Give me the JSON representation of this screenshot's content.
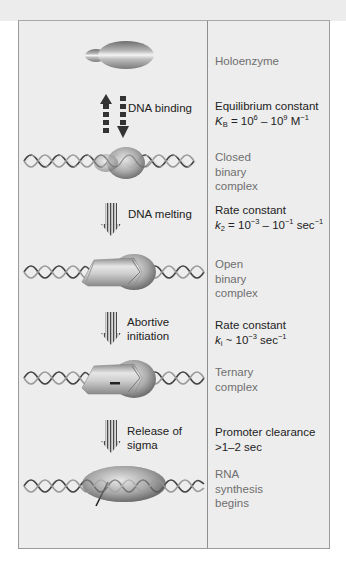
{
  "figure": {
    "colors": {
      "background": "#ececec",
      "frame_fill": "#ededed",
      "frame_border": "#9a9a9a",
      "state_text": "#6f6f6f",
      "step_text": "#222222",
      "dna_strand": "#555555",
      "enzyme_dark": "#7a7a7a",
      "enzyme_light": "#f0f0f0"
    },
    "states": [
      {
        "id": "holoenzyme",
        "label": "Holoenzyme"
      },
      {
        "id": "closed",
        "label": "Closed\nbinary\ncomplex"
      },
      {
        "id": "open",
        "label": "Open\nbinary\ncomplex"
      },
      {
        "id": "ternary",
        "label": "Ternary\ncomplex"
      },
      {
        "id": "rna",
        "label": "RNA\nsynthesis\nbegins"
      }
    ],
    "steps": [
      {
        "id": "dna-binding",
        "label": "DNA binding",
        "arrow": "reversible",
        "param_title": "Equilibrium constant",
        "symbol": "K",
        "symbol_sub": "B",
        "relation": " = 10",
        "exp1": "6",
        "mid": " – 10",
        "exp2": "9",
        "unit": " M",
        "unit_exp": "−1"
      },
      {
        "id": "dna-melting",
        "label": "DNA melting",
        "arrow": "forward",
        "param_title": "Rate constant",
        "symbol": "k",
        "symbol_sub": "2",
        "relation": " = 10",
        "exp1": "−3",
        "mid": " – 10",
        "exp2": "−1",
        "unit": " sec",
        "unit_exp": "−1"
      },
      {
        "id": "abortive-initiation",
        "label_line1": "Abortive",
        "label_line2": "initiation",
        "arrow": "forward",
        "param_title": "Rate constant",
        "symbol": "k",
        "symbol_sub": "i",
        "relation": " ~ 10",
        "exp1": "−3",
        "unit": " sec",
        "unit_exp": "−1"
      },
      {
        "id": "release-of-sigma",
        "label_line1": "Release of",
        "label_line2": "sigma",
        "arrow": "forward",
        "param_title": "Promoter clearance",
        "param_value": ">1–2 sec"
      }
    ]
  }
}
